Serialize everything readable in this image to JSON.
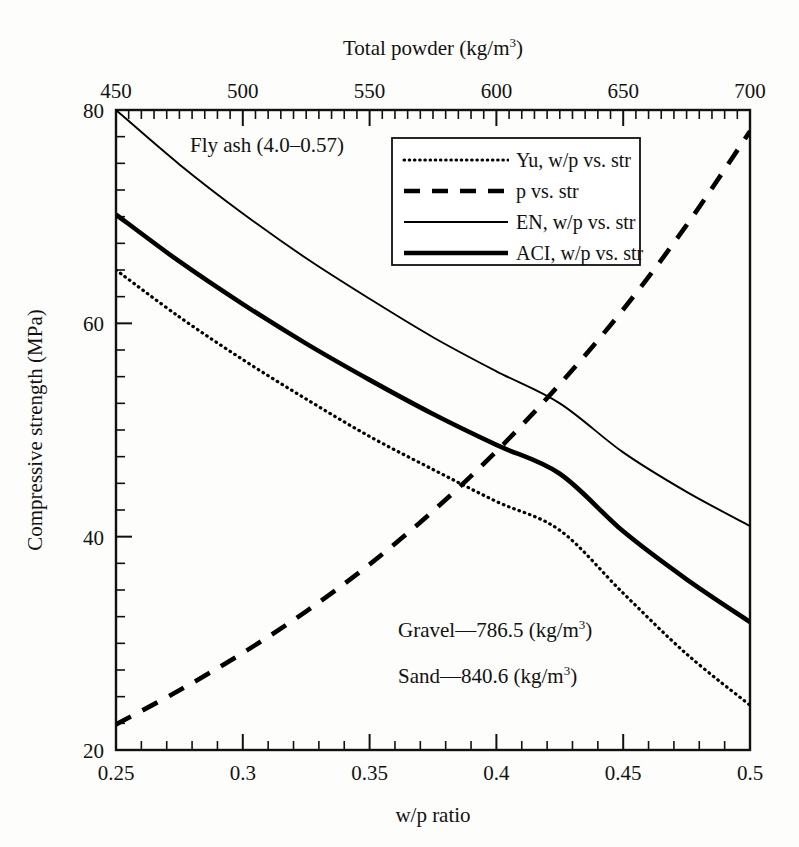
{
  "chart_data": {
    "type": "line",
    "title": "",
    "xlabel": "w/p ratio",
    "ylabel": "Compressive strength (MPa)",
    "x2label": "Total powder (kg/m3)",
    "x2label_base": "Total powder (kg/m",
    "x2label_sup": "3",
    "x2label_tail": ")",
    "xlim": [
      0.25,
      0.5
    ],
    "ylim": [
      20,
      80
    ],
    "x2lim": [
      450,
      700
    ],
    "xticks": [
      0.25,
      0.3,
      0.35,
      0.4,
      0.45,
      0.5
    ],
    "xticklabels": [
      "0.25",
      "0.3",
      "0.35",
      "0.4",
      "0.45",
      "0.5"
    ],
    "yticks": [
      20,
      40,
      60,
      80
    ],
    "yticklabels": [
      "20",
      "40",
      "60",
      "80"
    ],
    "x2ticks": [
      450,
      500,
      550,
      600,
      650,
      700
    ],
    "x2ticklabels": [
      "450",
      "500",
      "550",
      "600",
      "650",
      "700"
    ],
    "x_minor_step": 0.01,
    "y_minor_step": 2.5,
    "grid": false,
    "legend_position": "upper-center-right",
    "series": [
      {
        "name": "Yu, w/p vs. str",
        "style": "dotted",
        "x": [
          0.25,
          0.275,
          0.3,
          0.325,
          0.35,
          0.375,
          0.4,
          0.425,
          0.45,
          0.475,
          0.5
        ],
        "y": [
          65.0,
          60.6,
          56.6,
          52.9,
          49.4,
          46.3,
          43.3,
          40.6,
          34.7,
          29.0,
          24.2
        ]
      },
      {
        "name": "p vs. str",
        "style": "dashed",
        "x": [
          0.25,
          0.275,
          0.3,
          0.325,
          0.35,
          0.375,
          0.4,
          0.425,
          0.45,
          0.475,
          0.5
        ],
        "y": [
          22.4,
          25.6,
          29.1,
          33.0,
          37.4,
          42.4,
          48.0,
          54.3,
          61.3,
          69.2,
          78.0
        ]
      },
      {
        "name": "EN, w/p vs. str",
        "style": "thin-solid",
        "x": [
          0.25,
          0.275,
          0.3,
          0.325,
          0.35,
          0.375,
          0.4,
          0.425,
          0.45,
          0.475,
          0.5
        ],
        "y": [
          80.0,
          74.9,
          70.3,
          66.1,
          62.3,
          58.7,
          55.5,
          52.5,
          47.9,
          44.2,
          41.0
        ]
      },
      {
        "name": "ACI, w/p vs. str",
        "style": "thick-solid",
        "x": [
          0.25,
          0.275,
          0.3,
          0.325,
          0.35,
          0.375,
          0.4,
          0.425,
          0.45,
          0.475,
          0.5
        ],
        "y": [
          70.2,
          65.8,
          61.8,
          58.1,
          54.7,
          51.5,
          48.6,
          45.9,
          40.5,
          36.0,
          32.0
        ]
      }
    ],
    "annotations": [
      {
        "id": "fly-ash",
        "text": "Fly ash (4.0–0.57)",
        "x_px": 190,
        "y_px": 152
      },
      {
        "id": "gravel",
        "text_base": "Gravel—786.5 (kg/m",
        "text_sup": "3",
        "text_tail": ")",
        "x_px": 398,
        "y_px": 637
      },
      {
        "id": "sand",
        "text_base": "Sand—840.6 (kg/m",
        "text_sup": "3",
        "text_tail": ")",
        "x_px": 398,
        "y_px": 683
      }
    ],
    "legend_entries": [
      {
        "label": "Yu, w/p vs. str",
        "style": "dotted"
      },
      {
        "label": "p vs. str",
        "style": "dashed"
      },
      {
        "label": "EN, w/p vs. str",
        "style": "thin-solid"
      },
      {
        "label": "ACI, w/p vs. str",
        "style": "thick-solid"
      }
    ],
    "colors": {
      "line": "#000000",
      "frame": "#111111",
      "background": "#fdfdfc",
      "text": "#121212"
    }
  }
}
